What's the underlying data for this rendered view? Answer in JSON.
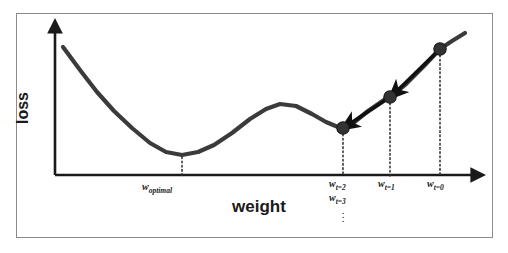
{
  "figure": {
    "type": "diagram",
    "background_color": "#ffffff",
    "frame_color": "#8b8b8b",
    "curve_color": "#3b3b3b",
    "axis_color": "#1a1a1a",
    "marker_color": "#333333",
    "arrow_color": "#111111",
    "dotted_line_color": "#2b2b2b"
  },
  "axes": {
    "ylabel": "loss",
    "xlabel": "weight"
  },
  "tick_labels": {
    "w_optimal": {
      "base": "w",
      "sub": "optimal"
    },
    "w_t2": {
      "base": "w",
      "sub": "t=2"
    },
    "w_t3": {
      "base": "w",
      "sub": "t=3"
    },
    "w_t1": {
      "base": "w",
      "sub": "t=1"
    },
    "w_t0": {
      "base": "w",
      "sub": "t=0"
    },
    "ellipsis": "⋮"
  },
  "chart_data": {
    "type": "line",
    "title": "",
    "xlabel": "weight",
    "ylabel": "loss",
    "grid": false,
    "legend": false,
    "axis_pixels": {
      "origin": [
        55,
        175
      ],
      "x_axis_end": [
        478,
        175
      ],
      "y_axis_top": [
        55,
        27
      ]
    },
    "loss_curve_pixels": [
      [
        63,
        47
      ],
      [
        80,
        70
      ],
      [
        97,
        92
      ],
      [
        114,
        111
      ],
      [
        132,
        128
      ],
      [
        150,
        143
      ],
      [
        166,
        152
      ],
      [
        182,
        155
      ],
      [
        198,
        152
      ],
      [
        214,
        145
      ],
      [
        232,
        133
      ],
      [
        250,
        119
      ],
      [
        266,
        109
      ],
      [
        280,
        104
      ],
      [
        296,
        106
      ],
      [
        312,
        114
      ],
      [
        326,
        122
      ],
      [
        338,
        127
      ],
      [
        343,
        128
      ],
      [
        352,
        124
      ],
      [
        368,
        111
      ],
      [
        384,
        100
      ],
      [
        390,
        97
      ],
      [
        406,
        84
      ],
      [
        424,
        66
      ],
      [
        440,
        49
      ],
      [
        452,
        41
      ],
      [
        465,
        33
      ]
    ],
    "descent_points": [
      {
        "label": "w_t0",
        "pixel": [
          440,
          49
        ],
        "x_tick_pixel": 440
      },
      {
        "label": "w_t1",
        "pixel": [
          390,
          97
        ],
        "x_tick_pixel": 390
      },
      {
        "label": "w_t2",
        "pixel": [
          343,
          128
        ],
        "x_tick_pixel": 343
      }
    ],
    "descent_arrows": [
      {
        "from": [
          440,
          49
        ],
        "to": [
          395,
          93
        ]
      },
      {
        "from": [
          390,
          97
        ],
        "to": [
          348,
          125
        ]
      }
    ],
    "optimal_point": {
      "label": "w_optimal",
      "pixel": [
        182,
        155
      ],
      "x_tick_pixel": 182
    },
    "local_minimum_pixel": [
      343,
      128
    ],
    "local_maximum_pixel": [
      280,
      104
    ]
  }
}
